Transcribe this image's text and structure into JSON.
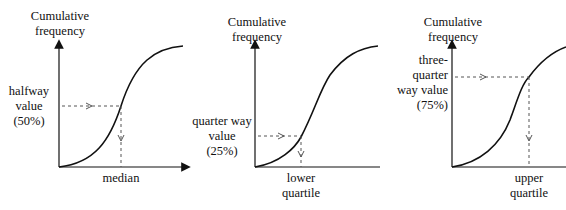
{
  "panels": [
    {
      "ylabel": [
        "Cumulative",
        "frequency"
      ],
      "level_label": [
        "halfway",
        "value",
        "(50%)"
      ],
      "xlabel": [
        "median"
      ]
    },
    {
      "ylabel": [
        "Cumulative",
        "frequency"
      ],
      "level_label": [
        "quarter way",
        "value",
        "(25%)"
      ],
      "xlabel": [
        "lower",
        "quartile"
      ]
    },
    {
      "ylabel": [
        "Cumulative",
        "frequency"
      ],
      "level_label": [
        "three-",
        "quarter",
        "way value",
        "(75%)"
      ],
      "xlabel": [
        "upper",
        "quartile"
      ]
    }
  ],
  "colors": {
    "line": "#111111",
    "dash": "#555555",
    "background": "#ffffff"
  }
}
